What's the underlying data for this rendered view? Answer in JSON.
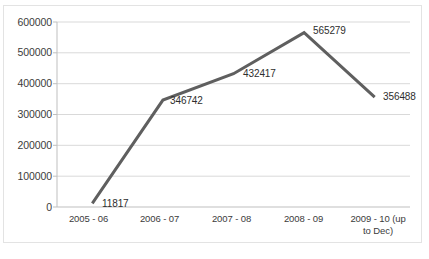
{
  "chart_data": {
    "type": "line",
    "title": "",
    "xlabel": "",
    "ylabel": "",
    "categories": [
      "2005 - 06",
      "2006 - 07",
      "2007 - 08",
      "2008 - 09",
      "2009 - 10 (up to Dec)"
    ],
    "category_lines": [
      [
        "2005 - 06"
      ],
      [
        "2006 - 07"
      ],
      [
        "2007 - 08"
      ],
      [
        "2008 - 09"
      ],
      [
        "2009 - 10 (up",
        "to Dec)"
      ]
    ],
    "values": [
      11817,
      346742,
      432417,
      565279,
      356488
    ],
    "point_labels": [
      "11817",
      "346742",
      "432417",
      "565279",
      "356488"
    ],
    "ylim": [
      0,
      600000
    ],
    "yticks": [
      0,
      100000,
      200000,
      300000,
      400000,
      500000,
      600000
    ],
    "ytick_labels": [
      "0",
      "100000",
      "200000",
      "300000",
      "400000",
      "500000",
      "600000"
    ],
    "grid": "horizontal",
    "legend": "none",
    "series": [
      {
        "name": "",
        "values": [
          11817,
          346742,
          432417,
          565279,
          356488
        ],
        "color": "#5f5f5f",
        "line_width": 3,
        "markers": "none"
      }
    ],
    "colors": {
      "line": "#5f5f5f",
      "gridline": "#d9d9d9",
      "axis": "#bfbfbf",
      "text": "#3b3b3b",
      "background": "#ffffff",
      "frame": "#e3e3e3"
    }
  }
}
